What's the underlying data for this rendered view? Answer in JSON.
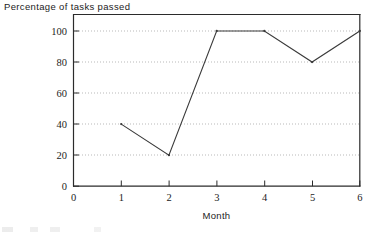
{
  "chart_data": {
    "type": "line",
    "title": "Percentage of tasks passed",
    "xlabel": "Month",
    "ylabel": "",
    "x": [
      1,
      2,
      3,
      4,
      5,
      6
    ],
    "values": [
      40,
      20,
      100,
      100,
      80,
      100
    ],
    "series": [
      {
        "name": "Percentage of tasks passed",
        "values": [
          40,
          20,
          100,
          100,
          80,
          100
        ]
      }
    ],
    "xlim": [
      0,
      6
    ],
    "ylim": [
      0,
      110
    ],
    "xticks": [
      "0",
      "1",
      "2",
      "3",
      "4",
      "5",
      "6"
    ],
    "yticks": [
      "0",
      "20",
      "40",
      "60",
      "80",
      "100"
    ],
    "xtick_values": [
      0,
      1,
      2,
      3,
      4,
      5,
      6
    ],
    "ytick_values": [
      0,
      20,
      40,
      60,
      80,
      100
    ],
    "grid": "horizontal-dotted",
    "legend": "none",
    "markers": "dot",
    "line_color": "#3a3a3a",
    "grid_color": "#b9b9b9",
    "axis_color": "#2b2b2b"
  },
  "figure": {
    "caption_fragment": ""
  }
}
